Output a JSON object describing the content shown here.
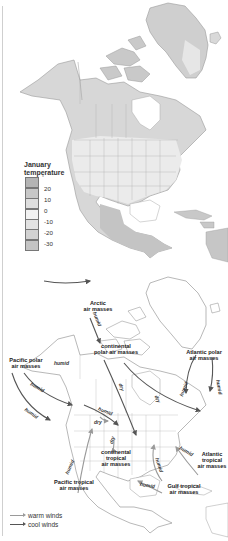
{
  "map1": {
    "legend": {
      "title_line1": "January",
      "title_line2": "temperature",
      "unit": "°",
      "ticks": [
        "20",
        "10",
        "0",
        "-10",
        "-20",
        "-30"
      ],
      "swatch_colors": [
        "#b4b4b4",
        "#c8c8c8",
        "#dedede",
        "#f2f2f2",
        "#e2e2e2",
        "#d2d2d2",
        "#c4c4c4"
      ]
    }
  },
  "map2": {
    "air_masses": {
      "arctic": [
        "Arctic",
        "air masses"
      ],
      "continental_polar": [
        "continental",
        "polar air masses"
      ],
      "pacific_polar": [
        "Pacific polar",
        "air masses"
      ],
      "atlantic_polar": [
        "Atlantic polar",
        "air masses"
      ],
      "continental_tropical": [
        "continental",
        "tropical",
        "air masses"
      ],
      "pacific_tropical": [
        "Pacific tropical",
        "air masses"
      ],
      "atlantic_tropical": [
        "Atlantic",
        "tropical",
        "air masses"
      ],
      "gulf_tropical": [
        "Gulf tropical",
        "air masses"
      ]
    },
    "wind_labels": {
      "humid": "humid",
      "dry": "dry"
    },
    "key": {
      "warm": "warm winds",
      "cool": "cool winds",
      "warm_color": "#9a9a9a",
      "cool_color": "#555555"
    }
  }
}
